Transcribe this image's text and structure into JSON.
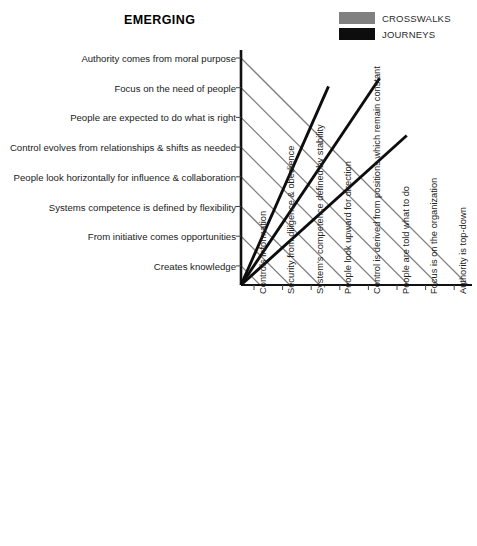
{
  "title": "EMERGING",
  "legend": {
    "position": "top-right",
    "items": [
      {
        "label": "CROSSWALKS",
        "color": "#808080",
        "name": "crosswalks"
      },
      {
        "label": "JOURNEYS",
        "color": "#0d0d0d",
        "name": "journeys"
      }
    ]
  },
  "chart_data": {
    "type": "line",
    "title": "EMERGING",
    "xlabel": "",
    "ylabel": "",
    "grid": false,
    "legend_position": "top-right",
    "y_categories": [
      "Authority comes from moral purpose",
      "Focus on the need of people",
      "People are expected to do what is right",
      "Control evolves from relationships & shifts as needed",
      "People look horizontally for influence & collaboration",
      "Systems competence is defined by flexibility",
      "From initiative comes opportunities",
      "Creates knowledge"
    ],
    "x_categories": [
      "Controls information",
      "Security from diligence & obedience",
      "System's competence defined by stability",
      "People look upward for direction",
      "Control is derived from positions which remain constant",
      "People are told what to do",
      "Focus is on the organization",
      "Authority is top-down"
    ],
    "xlim": [
      0,
      8
    ],
    "ylim": [
      0,
      8
    ],
    "series": [
      {
        "name": "CROSSWALKS",
        "type": "diagonal-connectors",
        "color": "#808080",
        "description": "45-degree gray lines descending from each vertical-axis item to the corresponding horizontal-axis item",
        "pairs": [
          {
            "from_y_index": 0,
            "to_x_index": 7
          },
          {
            "from_y_index": 1,
            "to_x_index": 6
          },
          {
            "from_y_index": 2,
            "to_x_index": 5
          },
          {
            "from_y_index": 3,
            "to_x_index": 4
          },
          {
            "from_y_index": 4,
            "to_x_index": 3
          },
          {
            "from_y_index": 5,
            "to_x_index": 2
          },
          {
            "from_y_index": 6,
            "to_x_index": 1
          },
          {
            "from_y_index": 7,
            "to_x_index": 0
          }
        ]
      },
      {
        "name": "JOURNEYS",
        "type": "rays-from-origin",
        "color": "#0d0d0d",
        "description": "Three thick black rays radiating upward-right from the origin",
        "rays": [
          {
            "id": "journey-1",
            "end_x": 3.03,
            "end_y": 6.76
          },
          {
            "id": "journey-2",
            "end_x": 4.8,
            "end_y": 7.04
          },
          {
            "id": "journey-3",
            "end_x": 5.74,
            "end_y": 5.09
          }
        ]
      }
    ]
  }
}
